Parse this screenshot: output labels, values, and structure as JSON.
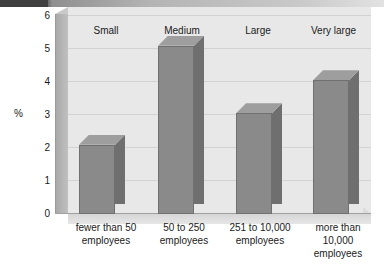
{
  "chart_data": {
    "type": "bar",
    "title": "",
    "subtitle": "",
    "xlabel": "",
    "ylabel": "%",
    "ylim": [
      0,
      6
    ],
    "yticks": [
      "0",
      "1",
      "2",
      "3",
      "4",
      "5",
      "6"
    ],
    "grid": true,
    "legend_position": "none",
    "categories": [
      "fewer than 50 employees",
      "50 to 250 employees",
      "251 to 10,000 employees",
      "more than 10,000 employees"
    ],
    "category_headers": [
      "Small",
      "Medium",
      "Large",
      "Very large"
    ],
    "values": [
      2.1,
      5.1,
      3.05,
      4.05
    ],
    "bars": [
      {
        "header": "Small",
        "label_line1": "fewer than 50",
        "label_line2": "employees",
        "label_line3": "",
        "value": 2.1
      },
      {
        "header": "Medium",
        "label_line1": "50 to 250",
        "label_line2": "employees",
        "label_line3": "",
        "value": 5.1
      },
      {
        "header": "Large",
        "label_line1": "251 to 10,000",
        "label_line2": "employees",
        "label_line3": "",
        "value": 3.05
      },
      {
        "header": "Very large",
        "label_line1": "more than",
        "label_line2": "10,000",
        "label_line3": "employees",
        "value": 4.05
      }
    ],
    "colors": {
      "bar_front": "#8a8a8a",
      "bar_side": "#6f6f6f",
      "bar_top": "#9e9e9e",
      "plot_background": "#e8e8e8",
      "gridline": "#d2d2d2",
      "axis_wall": "#b6b6b6",
      "top_band": "#4c4c4c",
      "text": "#1a1a1a"
    }
  }
}
